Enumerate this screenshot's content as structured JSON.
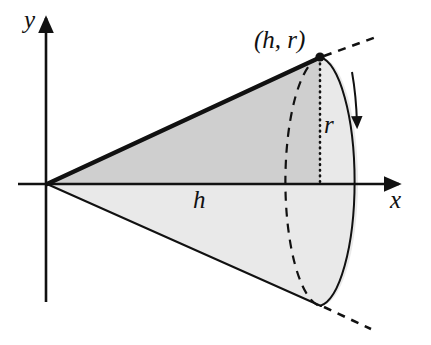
{
  "figure": {
    "background_color": "#ffffff",
    "stroke_color": "#111111",
    "fill_upper_triangle": "#cfcfcf",
    "fill_lower_region": "#e9e9e9",
    "fill_base_disk": "#e3e3e3"
  },
  "axes": {
    "x_label": "x",
    "y_label": "y",
    "origin": {
      "x": 47,
      "y": 184
    },
    "x_axis_end": {
      "x": 405,
      "y": 184
    },
    "y_axis_top": {
      "x": 46,
      "y": 13
    },
    "y_axis_bottom": {
      "x": 46,
      "y": 302
    }
  },
  "labels": {
    "point": "(h, r)",
    "height": "h",
    "radius": "r"
  },
  "geometry": {
    "apex": {
      "x": 47,
      "y": 184
    },
    "top_point": {
      "x": 320,
      "y": 57
    },
    "bottom_point": {
      "x": 320,
      "y": 306
    },
    "base_center": {
      "x": 320,
      "y": 184
    },
    "base_rx": 38,
    "base_ry": 125,
    "radius_segment": {
      "x": 320,
      "y_top": 57,
      "y_bottom": 184
    },
    "dashed_ray_upper": {
      "x1": 322,
      "y1": 56,
      "x2": 379,
      "y2": 36
    },
    "dashed_ray_lower": {
      "x1": 322,
      "y1": 307,
      "x2": 370,
      "y2": 329
    },
    "rotation_arrow_tip": {
      "x": 357,
      "y": 126
    }
  },
  "label_positions": {
    "y": {
      "x": 24,
      "y": 28
    },
    "x": {
      "x": 390,
      "y": 207
    },
    "h": {
      "x": 193,
      "y": 207
    },
    "r": {
      "x": 325,
      "y": 132
    },
    "point": {
      "x": 255,
      "y": 48
    }
  }
}
